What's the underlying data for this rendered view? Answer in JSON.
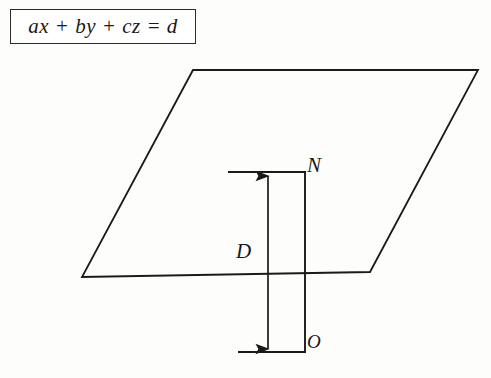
{
  "figure": {
    "formula_box": {
      "equation": "ax + by + cz = d",
      "border_color": "#2b2b2b",
      "background": "#ffffff"
    },
    "labels": {
      "normal_point": "N",
      "distance": "D",
      "origin": "O"
    },
    "caption": "",
    "stroke_color": "#1a1a1a",
    "background_color": "#fdfdfc",
    "geometry": {
      "plane": {
        "shape": "parallelogram",
        "points": [
          [
            193,
            70
          ],
          [
            478,
            70
          ],
          [
            370,
            272
          ],
          [
            82,
            277
          ]
        ]
      },
      "top_segment": {
        "x1": 228,
        "y1": 172,
        "x2": 305,
        "y2": 172
      },
      "bottom_segment": {
        "x1": 238,
        "y1": 352,
        "x2": 305,
        "y2": 352
      },
      "right_vertical": {
        "x": 305,
        "y1": 172,
        "y2": 352
      },
      "distance_arrow": {
        "x": 268,
        "y_top": 174,
        "y_bottom": 352,
        "double_headed": true
      }
    }
  }
}
